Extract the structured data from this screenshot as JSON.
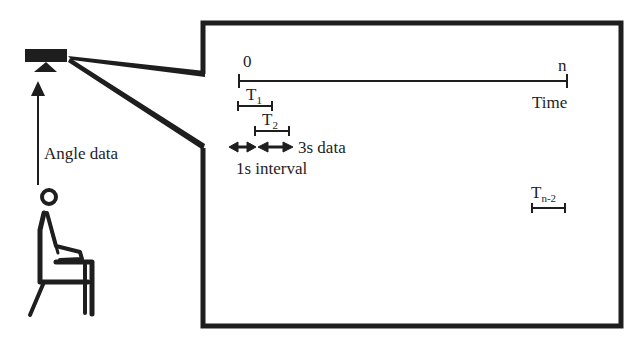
{
  "diagram": {
    "sensor": {
      "label": ""
    },
    "arrow_label": "Angle data",
    "timeline": {
      "start_label": "0",
      "end_label": "n",
      "axis_label": "Time"
    },
    "windows": [
      {
        "name": "T",
        "sub": "1"
      },
      {
        "name": "T",
        "sub": "2"
      },
      {
        "name": "T",
        "sub": "n-2"
      }
    ],
    "annotations": {
      "window_length": "3s data",
      "interval": "1s interval"
    },
    "colors": {
      "stroke": "#1e1e1e",
      "background": "#ffffff"
    }
  }
}
